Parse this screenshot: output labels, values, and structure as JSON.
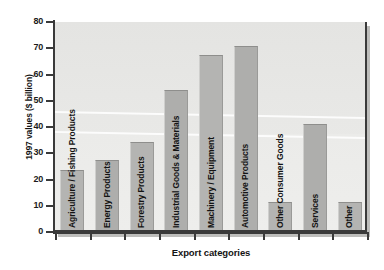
{
  "chart_data": {
    "type": "bar",
    "title": "",
    "xlabel": "Export categories",
    "ylabel": "1997 values ($ billion)",
    "ylim": [
      0,
      80
    ],
    "yticks": [
      0,
      10,
      20,
      30,
      40,
      50,
      60,
      70,
      80
    ],
    "grid": false,
    "legend": null,
    "categories": [
      "Agriculture / Fishing Products",
      "Energy Products",
      "Forestry Products",
      "Industrial Goods & Materials",
      "Machinery / Equipment",
      "Automotive Products",
      "Other Consumer Goods",
      "Services",
      "Other"
    ],
    "values": [
      23,
      26.5,
      33.5,
      53.5,
      66.5,
      70,
      10.5,
      40.5,
      10.5
    ],
    "bar_color": "#b4b4b2",
    "plot_background": "#e6e6e4",
    "axis_color": "#3a3a3a",
    "text_color": "#141414"
  }
}
